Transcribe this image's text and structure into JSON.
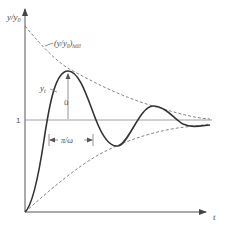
{
  "figure": {
    "type": "damped oscillation step response",
    "y_axis_label": "y/y",
    "y_axis_label_sub": "0",
    "x_axis_label": "t",
    "level_label": "1",
    "envelope_label_main": "(y/y",
    "envelope_label_sub0": "0",
    "envelope_label_close": ")",
    "envelope_label_sub": "hüll",
    "curve_label_main": "y",
    "curve_label_sub": "t",
    "overshoot_label": "ü",
    "period_label": "π/ω"
  },
  "colors": {
    "background": "#ffffff",
    "axis": "#555555",
    "curve": "#333333",
    "envelope": "#666666",
    "reference_line": "#888888"
  }
}
